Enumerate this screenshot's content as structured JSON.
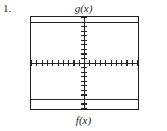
{
  "problem": {
    "number": "1."
  },
  "figure": {
    "top_label": "g(x)",
    "bottom_label": "f(x)",
    "border_color": "#20201f",
    "axis_color": "#232323",
    "curve_color": "#2b2b2b",
    "background": "#ffffff"
  },
  "chart_data": {
    "type": "line",
    "title": "",
    "subtitle": "",
    "xlabel": "",
    "ylabel": "",
    "grid": false,
    "legend": false,
    "axes": {
      "x_axis_visible": true,
      "y_axis_visible": true,
      "x_axis_y_value": 0,
      "y_axis_x_value": 0,
      "xlim": [
        -10,
        10
      ],
      "ylim": [
        -10,
        10
      ],
      "x_tick_step": 1,
      "y_tick_step": 1,
      "x_tick_count": 20,
      "y_tick_count": 20,
      "tick_labels_shown": false
    },
    "series": [
      {
        "name": "g(x)",
        "kind": "constant",
        "value": 9,
        "x": [
          -10,
          10
        ],
        "values": [
          9,
          9
        ],
        "annotation": "g(x)",
        "annotation_position": "above-window-top-center"
      },
      {
        "name": "f(x)",
        "kind": "constant",
        "value": -8,
        "x": [
          -10,
          10
        ],
        "values": [
          -8,
          -8
        ],
        "annotation": "f(x)",
        "annotation_position": "below-window-bottom-center"
      }
    ]
  }
}
